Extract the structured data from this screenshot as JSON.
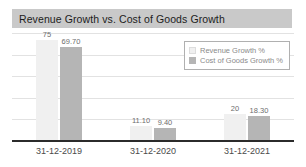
{
  "card": {
    "title": "Revenue Growth vs. Cost of Goods Growth"
  },
  "legend": {
    "items": [
      {
        "label": "Revenue Growth %",
        "color": "#f0f0f0"
      },
      {
        "label": "Cost of Goods Growth %",
        "color": "#b5b5b5"
      }
    ]
  },
  "chart_data": {
    "type": "bar",
    "title": "Revenue Growth vs. Cost of Goods Growth",
    "xlabel": "",
    "ylabel": "",
    "categories": [
      "31-12-2019",
      "31-12-2020",
      "31-12-2021"
    ],
    "series": [
      {
        "name": "Revenue Growth %",
        "color": "#f0f0f0",
        "values": [
          75,
          11.1,
          20
        ],
        "labels": [
          "75",
          "11.10",
          "20"
        ]
      },
      {
        "name": "Cost of Goods Growth %",
        "color": "#b5b5b5",
        "values": [
          69.7,
          9.4,
          18.3
        ],
        "labels": [
          "69.70",
          "9.40",
          "18.30"
        ]
      }
    ],
    "ylim": [
      0,
      80
    ],
    "gridlines": [
      0,
      16,
      32,
      48,
      64,
      80
    ],
    "grid": true,
    "legend_position": "top-right"
  }
}
